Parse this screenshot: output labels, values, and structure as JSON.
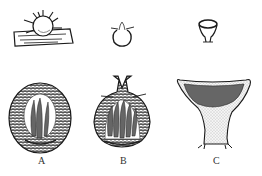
{
  "figure": {
    "panels": [
      {
        "id": "A",
        "label": "A",
        "top_view": "spherical fruiting body with radiating appendages on substrate",
        "section": "closed globose body with asci inside"
      },
      {
        "id": "B",
        "label": "B",
        "top_view": "flask-shaped body with ostiole",
        "section": "flask-shaped body with neck opening and asci"
      },
      {
        "id": "C",
        "label": "C",
        "top_view": "cup-shaped body",
        "section": "cup-shaped body with exposed hymenium on stalk"
      }
    ]
  },
  "colors": {
    "ink": "#1a1a1a",
    "background": "#ffffff",
    "stipple": "#777777"
  }
}
